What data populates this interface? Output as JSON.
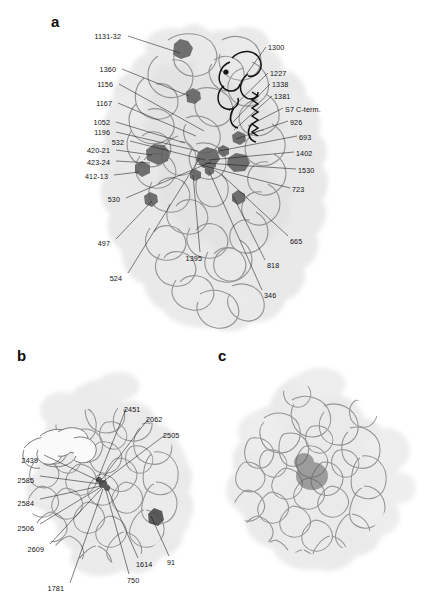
{
  "figure": {
    "panels": [
      {
        "id": "a",
        "letter": "a",
        "labels": [
          {
            "text": "1131-32",
            "x": 121,
            "y": 33,
            "align": "right",
            "lx": 128,
            "ly": 36,
            "tx": 180,
            "ty": 53
          },
          {
            "text": "1360",
            "x": 116,
            "y": 66,
            "align": "right",
            "lx": 122,
            "ly": 69,
            "tx": 189,
            "ty": 96
          },
          {
            "text": "1156",
            "x": 113,
            "y": 81,
            "align": "right",
            "lx": 119,
            "ly": 84,
            "tx": 204,
            "ty": 131
          },
          {
            "text": "1167",
            "x": 112,
            "y": 100,
            "align": "right",
            "lx": 118,
            "ly": 103,
            "tx": 196,
            "ty": 136
          },
          {
            "text": "1052",
            "x": 110,
            "y": 119,
            "align": "right",
            "lx": 116,
            "ly": 122,
            "tx": 185,
            "ty": 143
          },
          {
            "text": "1196",
            "x": 110,
            "y": 129,
            "align": "right",
            "lx": 116,
            "ly": 132,
            "tx": 198,
            "ty": 151
          },
          {
            "text": "532",
            "x": 124,
            "y": 139,
            "align": "right",
            "lx": 130,
            "ly": 141,
            "tx": 205,
            "ty": 160
          },
          {
            "text": "420-21",
            "x": 110,
            "y": 147,
            "align": "right",
            "lx": 116,
            "ly": 150,
            "tx": 152,
            "ty": 155
          },
          {
            "text": "423-24",
            "x": 110,
            "y": 159,
            "align": "right",
            "lx": 116,
            "ly": 161,
            "tx": 150,
            "ty": 163
          },
          {
            "text": "412-13",
            "x": 108,
            "y": 173,
            "align": "right",
            "lx": 114,
            "ly": 175,
            "tx": 139,
            "ty": 172
          },
          {
            "text": "530",
            "x": 120,
            "y": 196,
            "align": "right",
            "lx": 126,
            "ly": 198,
            "tx": 211,
            "ty": 162
          },
          {
            "text": "497",
            "x": 110,
            "y": 240,
            "align": "right",
            "lx": 116,
            "ly": 239,
            "tx": 152,
            "ty": 201
          },
          {
            "text": "524",
            "x": 122,
            "y": 275,
            "align": "right",
            "lx": 128,
            "ly": 273,
            "tx": 199,
            "ty": 159
          },
          {
            "text": "1395",
            "x": 202,
            "y": 255,
            "align": "right",
            "lx": 200,
            "ly": 252,
            "tx": 193,
            "ty": 175
          },
          {
            "text": "1300",
            "x": 268,
            "y": 44,
            "align": "left",
            "lx": 266,
            "ly": 47,
            "tx": 240,
            "ty": 83
          },
          {
            "text": "1227",
            "x": 270,
            "y": 70,
            "align": "left",
            "lx": 268,
            "ly": 73,
            "tx": 229,
            "ty": 111
          },
          {
            "text": "1338",
            "x": 272,
            "y": 81,
            "align": "left",
            "lx": 270,
            "ly": 84,
            "tx": 233,
            "ty": 122
          },
          {
            "text": "1381",
            "x": 274,
            "y": 93,
            "align": "left",
            "lx": 272,
            "ly": 96,
            "tx": 234,
            "ty": 130
          },
          {
            "text": "S7 C-term.",
            "x": 285,
            "y": 106,
            "align": "left",
            "lx": 283,
            "ly": 108,
            "tx": 248,
            "ty": 126
          },
          {
            "text": "926",
            "x": 290,
            "y": 119,
            "align": "left",
            "lx": 288,
            "ly": 121,
            "tx": 236,
            "ty": 139
          },
          {
            "text": "693",
            "x": 299,
            "y": 134,
            "align": "left",
            "lx": 297,
            "ly": 136,
            "tx": 219,
            "ty": 151
          },
          {
            "text": "1402",
            "x": 296,
            "y": 150,
            "align": "left",
            "lx": 294,
            "ly": 152,
            "tx": 209,
            "ty": 160
          },
          {
            "text": "1530",
            "x": 298,
            "y": 167,
            "align": "left",
            "lx": 296,
            "ly": 169,
            "tx": 205,
            "ty": 163
          },
          {
            "text": "723",
            "x": 292,
            "y": 186,
            "align": "left",
            "lx": 290,
            "ly": 188,
            "tx": 197,
            "ty": 164
          },
          {
            "text": "665",
            "x": 290,
            "y": 238,
            "align": "left",
            "lx": 288,
            "ly": 236,
            "tx": 221,
            "ty": 174
          },
          {
            "text": "818",
            "x": 267,
            "y": 262,
            "align": "left",
            "lx": 265,
            "ly": 260,
            "tx": 233,
            "ty": 196
          },
          {
            "text": "346",
            "x": 264,
            "y": 292,
            "align": "left",
            "lx": 262,
            "ly": 290,
            "tx": 209,
            "ty": 171
          }
        ]
      },
      {
        "id": "b",
        "letter": "b",
        "labels": [
          {
            "text": "2451",
            "x": 124,
            "y": 406,
            "align": "left",
            "lx": 126,
            "ly": 409,
            "tx": 97,
            "ty": 481
          },
          {
            "text": "2062",
            "x": 146,
            "y": 416,
            "align": "left",
            "lx": 148,
            "ly": 419,
            "tx": 99,
            "ty": 483
          },
          {
            "text": "2505",
            "x": 163,
            "y": 432,
            "align": "left",
            "lx": 165,
            "ly": 435,
            "tx": 100,
            "ty": 484
          },
          {
            "text": "2439",
            "x": 38,
            "y": 457,
            "align": "right",
            "lx": 44,
            "ly": 455,
            "tx": 99,
            "ty": 481
          },
          {
            "text": "2585",
            "x": 34,
            "y": 477,
            "align": "right",
            "lx": 40,
            "ly": 476,
            "tx": 100,
            "ty": 484
          },
          {
            "text": "2584",
            "x": 34,
            "y": 500,
            "align": "right",
            "lx": 40,
            "ly": 499,
            "tx": 101,
            "ty": 486
          },
          {
            "text": "2506",
            "x": 34,
            "y": 525,
            "align": "right",
            "lx": 40,
            "ly": 524,
            "tx": 101,
            "ty": 487
          },
          {
            "text": "2609",
            "x": 44,
            "y": 546,
            "align": "right",
            "lx": 50,
            "ly": 544,
            "tx": 102,
            "ty": 488
          },
          {
            "text": "1781",
            "x": 64,
            "y": 585,
            "align": "right",
            "lx": 70,
            "ly": 583,
            "tx": 103,
            "ty": 489
          },
          {
            "text": "750",
            "x": 127,
            "y": 577,
            "align": "left",
            "lx": 129,
            "ly": 574,
            "tx": 106,
            "ty": 491
          },
          {
            "text": "1614",
            "x": 136,
            "y": 561,
            "align": "left",
            "lx": 138,
            "ly": 558,
            "tx": 108,
            "ty": 490
          },
          {
            "text": "91",
            "x": 167,
            "y": 559,
            "align": "left",
            "lx": 169,
            "ly": 556,
            "tx": 151,
            "ty": 516
          }
        ]
      },
      {
        "id": "c",
        "letter": "c",
        "labels": []
      }
    ]
  },
  "colors": {
    "background": "#ffffff",
    "label_text": "#111111",
    "panel_letter": "#0d0d0d",
    "surface_fill": "#dddddd",
    "surface_fill_light": "#e8e8e8",
    "ribbon": "#8a8a8a",
    "ribbon_dark": "#6f6f6f",
    "highlight_dark": "#5a5a5a",
    "s7_cterm": "#151515",
    "white_ribbon": "#fbfbfb",
    "leader_line": "#1a1a1a"
  }
}
